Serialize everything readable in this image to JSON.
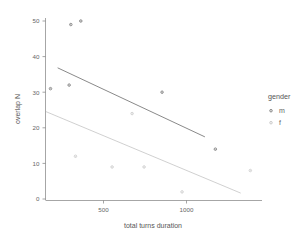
{
  "chart_data": {
    "type": "scatter",
    "title": "",
    "xlabel": "total turns duration",
    "ylabel": "overlap N",
    "xlim": [
      120,
      1420
    ],
    "ylim": [
      0,
      52
    ],
    "xticks": [
      500,
      1000
    ],
    "xticklabels": [
      "500",
      "1000"
    ],
    "yticks": [
      0,
      10,
      20,
      30,
      40,
      50
    ],
    "yticklabels": [
      "0",
      "10",
      "20",
      "30",
      "40",
      "50"
    ],
    "grid": false,
    "legend": {
      "title": "gender",
      "position": "right",
      "entries": [
        {
          "label": "m",
          "color": "#6b6b6b"
        },
        {
          "label": "f",
          "color": "#bdbdbd"
        }
      ]
    },
    "series": [
      {
        "name": "m",
        "color": "#6b6b6b",
        "points": [
          {
            "x": 150,
            "y": 31
          },
          {
            "x": 262,
            "y": 32
          },
          {
            "x": 272,
            "y": 49
          },
          {
            "x": 332,
            "y": 50
          },
          {
            "x": 820,
            "y": 30
          },
          {
            "x": 1140,
            "y": 14
          }
        ],
        "fit_line": {
          "x1": 195,
          "y1": 36.8,
          "x2": 1075,
          "y2": 17.5
        }
      },
      {
        "name": "f",
        "color": "#c4c4c4",
        "points": [
          {
            "x": 300,
            "y": 12
          },
          {
            "x": 520,
            "y": 9
          },
          {
            "x": 640,
            "y": 24
          },
          {
            "x": 712,
            "y": 9
          },
          {
            "x": 940,
            "y": 2
          },
          {
            "x": 1350,
            "y": 8
          }
        ],
        "fit_line": {
          "x1": 125,
          "y1": 24.5,
          "x2": 1290,
          "y2": 1.7
        }
      }
    ]
  }
}
